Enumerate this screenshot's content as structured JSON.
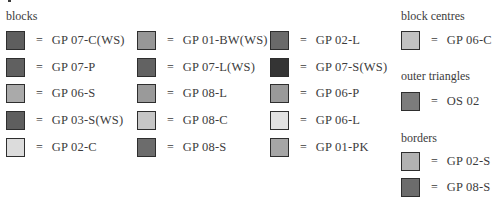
{
  "legend": {
    "blocks": {
      "title": "blocks",
      "columns": [
        [
          {
            "code": "GP 07-C(WS)",
            "color": "#5e5e5e"
          },
          {
            "code": "GP 07-P",
            "color": "#606060"
          },
          {
            "code": "GP 06-S",
            "color": "#aaaaaa"
          },
          {
            "code": "GP 03-S(WS)",
            "color": "#5e5e5e"
          },
          {
            "code": "GP 02-C",
            "color": "#dcdcdc"
          }
        ],
        [
          {
            "code": "GP 01-BW(WS)",
            "color": "#979797"
          },
          {
            "code": "GP 07-L(WS)",
            "color": "#626262"
          },
          {
            "code": "GP 08-L",
            "color": "#9a9a9a"
          },
          {
            "code": "GP 08-C",
            "color": "#c6c6c6"
          },
          {
            "code": "GP 08-S",
            "color": "#6c6c6c"
          }
        ],
        [
          {
            "code": "GP 02-L",
            "color": "#6a6a6a"
          },
          {
            "code": "GP 07-S(WS)",
            "color": "#343434"
          },
          {
            "code": "GP 06-P",
            "color": "#9a9a9a"
          },
          {
            "code": "GP 06-L",
            "color": "#e2e2e2"
          },
          {
            "code": "GP 01-PK",
            "color": "#a6a6a6"
          }
        ]
      ]
    },
    "block_centres": {
      "title": "block centres",
      "items": [
        {
          "code": "GP 06-C",
          "color": "#c2c2c2"
        }
      ]
    },
    "outer_triangles": {
      "title": "outer triangles",
      "items": [
        {
          "code": "OS 02",
          "color": "#7c7c7c"
        }
      ]
    },
    "borders": {
      "title": "borders",
      "items": [
        {
          "code": "GP 02-S",
          "color": "#b2b2b2"
        },
        {
          "code": "GP 08-S",
          "color": "#6c6c6c"
        }
      ]
    },
    "equals_sign": "="
  }
}
